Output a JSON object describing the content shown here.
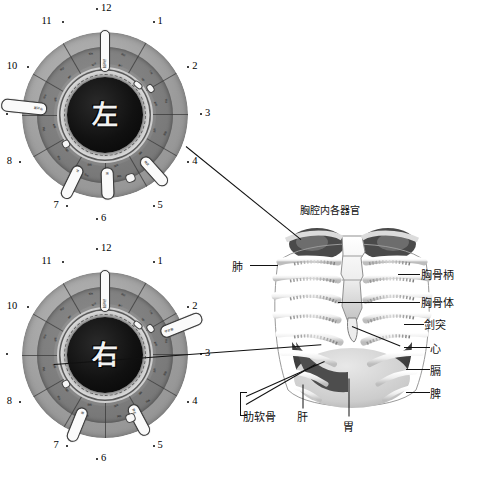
{
  "figure": {
    "kind": "iris-diagnosis-chart-with-thoracic-anatomy",
    "palette": {
      "ink": "#111111",
      "ring_light": "#b9b9b9",
      "ring_mid": "#7d7d7d",
      "pupil": "#0a0a0a",
      "marker": "#fafafa"
    }
  },
  "iris_charts": [
    {
      "id": "left-iris",
      "center_char": "左",
      "center_label": "left eye",
      "clock_numbers": [
        "1",
        "2",
        "3",
        "4",
        "5",
        "6",
        "7",
        "8",
        "9",
        "10",
        "11",
        "12"
      ],
      "markers": [
        {
          "name": "marker-9-oclock",
          "text": "甲状腺"
        },
        {
          "name": "marker-12-oclock",
          "text": "脑神经"
        },
        {
          "name": "marker-5-oclock",
          "text": "肺支"
        },
        {
          "name": "marker-6-oclock",
          "text": "胃"
        },
        {
          "name": "marker-7-oclock",
          "text": "肝"
        }
      ]
    },
    {
      "id": "right-iris",
      "center_char": "右",
      "center_label": "right eye",
      "clock_numbers": [
        "1",
        "2",
        "3",
        "4",
        "5",
        "6",
        "7",
        "8",
        "9",
        "10",
        "11",
        "12"
      ],
      "markers": [
        {
          "name": "marker-2-oclock",
          "text": "甲状腺"
        },
        {
          "name": "marker-12-oclock",
          "text": "脑神经"
        },
        {
          "name": "marker-5-oclock",
          "text": "肺支"
        },
        {
          "name": "marker-7-oclock",
          "text": "胃"
        }
      ]
    }
  ],
  "anatomy": {
    "title": "胸腔内各器官",
    "labels_left": [
      {
        "name": "label-lung",
        "text": "肺"
      },
      {
        "name": "label-costal-cartilage",
        "text": "肋软骨"
      }
    ],
    "labels_right": [
      {
        "name": "label-manubrium",
        "text": "胸骨柄"
      },
      {
        "name": "label-sternum-body",
        "text": "胸骨体"
      },
      {
        "name": "label-xiphoid",
        "text": "剑突"
      },
      {
        "name": "label-heart",
        "text": "心"
      },
      {
        "name": "label-diaphragm",
        "text": "膈"
      },
      {
        "name": "label-spleen",
        "text": "脾"
      }
    ],
    "labels_bottom": [
      {
        "name": "label-liver",
        "text": "肝"
      },
      {
        "name": "label-stomach",
        "text": "胃"
      }
    ]
  },
  "sector_micro_text": [
    "脑",
    "额",
    "鼻",
    "咽",
    "肺",
    "心",
    "肝",
    "胃",
    "肾",
    "腰",
    "膀",
    "脾",
    "胆",
    "肠",
    "胰",
    "甲",
    "颈",
    "背",
    "腹",
    "腿",
    "足",
    "耳",
    "眼",
    "喉"
  ]
}
